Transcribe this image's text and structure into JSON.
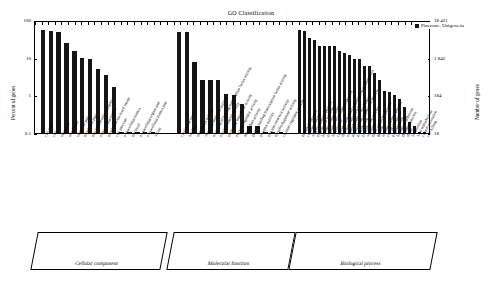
{
  "chart_data": {
    "type": "bar",
    "title": "GO Classification",
    "xlabel": "",
    "ylabel": "Percent of genes",
    "ylabel_right": "Number of genes",
    "scale": "log",
    "ylim": [
      0.1,
      100
    ],
    "yticks": [
      "0.1",
      "1",
      "10",
      "100"
    ],
    "yticks_right": [
      "18",
      "184",
      "1 842",
      "18 421"
    ],
    "grid": false,
    "legend_position": "top-right",
    "legend": [
      {
        "name": "Pinecone. Unigene.fa",
        "color": "#151515"
      }
    ],
    "groups": [
      {
        "name": "Cellular component",
        "categories": [
          "cell part",
          "cell",
          "organelle",
          "membrane",
          "organelle part",
          "membrane part",
          "macromolecular complex",
          "extracellular region",
          "membrane-enclosed lumen",
          "cell junction",
          "extracellular matrix",
          "nucleoid",
          "extracellular region part",
          "extracellular matrix part",
          "virion"
        ],
        "values": [
          55,
          50,
          47,
          24,
          15,
          10,
          9.5,
          5,
          3.5,
          1.7,
          0.1,
          0.1,
          0.1,
          0.1,
          0.1
        ]
      },
      {
        "name": "Molecular function",
        "categories": [
          "catalytic activity",
          "binding",
          "transporter activity",
          "structural molecule activity",
          "nucleic acid binding transcription factor activity",
          "electron carrier activity",
          "molecular transducer activity",
          "enzyme regulator activity",
          "antioxidant activity",
          "protein binding transcription factor activity",
          "receptor activity",
          "nutrient reservoir activity",
          "metallochaperone activity",
          "channel regulator activity"
        ],
        "values": [
          48,
          47,
          7.5,
          2.5,
          2.5,
          2.5,
          1.1,
          1.0,
          0.6,
          0.15,
          0.15,
          0.1,
          0.1,
          0.1
        ]
      },
      {
        "name": "Biological process",
        "categories": [
          "metabolic process",
          "cellular process",
          "single-organism process",
          "response to stimulus",
          "biological regulation",
          "regulation of biological process",
          "localization",
          "cellular component organization or biogenesis",
          "developmental process",
          "establishment of localization",
          "multicellular organismal process",
          "reproduction",
          "reproductive process",
          "signaling",
          "multi-organism process",
          "growth",
          "immune system process",
          "cell proliferation",
          "pigmentation",
          "biological adhesion",
          "rhythmic process",
          "death",
          "locomotion",
          "viral reproduction",
          "carbon utilization",
          "cell killing"
        ],
        "values": [
          55,
          50,
          33,
          30,
          20,
          20,
          20,
          20,
          15,
          13,
          12,
          9,
          9,
          6,
          6,
          4,
          2.5,
          1.3,
          1.2,
          1.0,
          0.8,
          0.5,
          0.2,
          0.15,
          0.1,
          0.1
        ]
      }
    ]
  }
}
